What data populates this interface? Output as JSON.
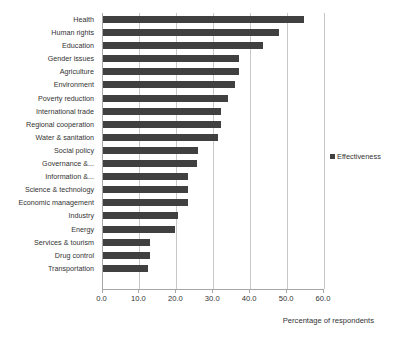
{
  "chart_data": {
    "type": "bar",
    "orientation": "horizontal",
    "title": "",
    "xlabel": "Percentage of respondents",
    "ylabel": "",
    "xlim": [
      0.0,
      60.0
    ],
    "xticks": [
      "0.0",
      "10.0",
      "20.0",
      "30.0",
      "40.0",
      "50.0",
      "60.0"
    ],
    "xtick_values": [
      0,
      10,
      20,
      30,
      40,
      50,
      60
    ],
    "grid": "vertical",
    "legend": {
      "position": "right",
      "entries": [
        {
          "label": "Effectiveness",
          "color": "#404040"
        }
      ]
    },
    "categories": [
      "Health",
      "Human rights",
      "Education",
      "Gender issues",
      "Agriculture",
      "Environment",
      "Poverty reduction",
      "International trade",
      "Regional cooperation",
      "Water & sanitation",
      "Social policy",
      "Governance &...",
      "Information &...",
      "Science & technology",
      "Economic management",
      "Industry",
      "Energy",
      "Services & tourism",
      "Drug control",
      "Transportation"
    ],
    "series": [
      {
        "name": "Effectiveness",
        "color": "#404040",
        "values": [
          54.5,
          47.8,
          43.5,
          37.0,
          37.0,
          36.0,
          34.0,
          32.2,
          32.2,
          31.2,
          26.0,
          25.5,
          23.2,
          23.2,
          23.2,
          20.5,
          19.7,
          12.8,
          12.8,
          12.2
        ]
      }
    ]
  }
}
